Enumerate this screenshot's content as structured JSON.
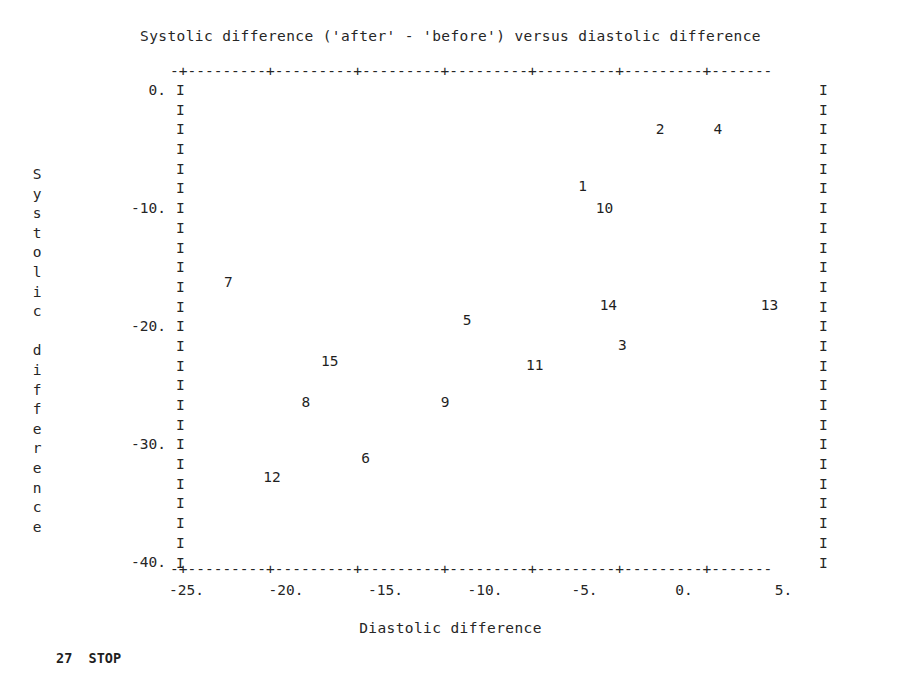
{
  "title": "Systolic difference ('after' - 'before') versus diastolic difference",
  "footer": "27  STOP",
  "axis_art": {
    "top_line": "-+---------+---------+---------+---------+---------+---------+-------",
    "bottom_line": "-+---------+---------+---------+---------+---------+---------+-------",
    "left_border": "I\nI\nI\nI\nI\nI\nI\nI\nI\nI\nI\nI\nI\nI\nI\nI\nI\nI\nI\nI\nI\nI\nI\nI\nI",
    "right_border": "I\nI\nI\nI\nI\nI\nI\nI\nI\nI\nI\nI\nI\nI\nI\nI\nI\nI\nI\nI\nI\nI\nI\nI\nI"
  },
  "ylabel_chars": [
    "S",
    "y",
    "s",
    "t",
    "o",
    "l",
    "i",
    "c",
    "",
    "d",
    "i",
    "f",
    "f",
    "e",
    "r",
    "e",
    "n",
    "c",
    "e"
  ],
  "colors": {
    "ink": "#262626",
    "background": "#ffffff"
  },
  "chart_data": {
    "type": "scatter",
    "title": "Systolic difference ('after' - 'before') versus diastolic difference",
    "xlabel": "Diastolic difference",
    "ylabel": "Systolic difference",
    "xlim": [
      -26.0,
      8.0
    ],
    "ylim": [
      -41.5,
      1.5
    ],
    "xticks": [
      -25,
      -20,
      -15,
      -10,
      -5,
      0,
      5
    ],
    "xtick_labels": [
      "-25.",
      "-20.",
      "-15.",
      "-10.",
      "-5.",
      "0.",
      "5."
    ],
    "yticks": [
      0,
      -10,
      -20,
      -30,
      -40
    ],
    "ytick_labels": [
      "0.",
      "-10.",
      "-20.",
      "-30.",
      "-40."
    ],
    "grid": false,
    "legend": false,
    "marker_style": "point-label-number",
    "points": [
      {
        "label": "1",
        "x": -5.1,
        "y": -8.1
      },
      {
        "label": "2",
        "x": -1.2,
        "y": -3.3
      },
      {
        "label": "3",
        "x": -3.1,
        "y": -21.6
      },
      {
        "label": "4",
        "x": 1.7,
        "y": -3.3
      },
      {
        "label": "5",
        "x": -10.9,
        "y": -19.5
      },
      {
        "label": "6",
        "x": -16.0,
        "y": -31.2
      },
      {
        "label": "7",
        "x": -22.9,
        "y": -16.3
      },
      {
        "label": "8",
        "x": -19.0,
        "y": -26.4
      },
      {
        "label": "9",
        "x": -12.0,
        "y": -26.4
      },
      {
        "label": "10",
        "x": -4.0,
        "y": -10.0
      },
      {
        "label": "11",
        "x": -7.5,
        "y": -23.3
      },
      {
        "label": "12",
        "x": -20.7,
        "y": -32.8
      },
      {
        "label": "13",
        "x": 4.3,
        "y": -18.2
      },
      {
        "label": "14",
        "x": -3.8,
        "y": -18.2
      },
      {
        "label": "15",
        "x": -17.8,
        "y": -23.0
      }
    ]
  }
}
